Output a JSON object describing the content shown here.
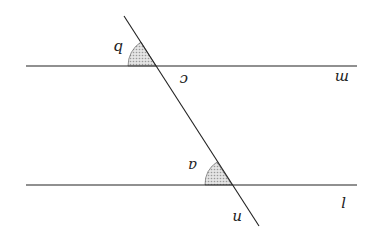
{
  "diagram": {
    "rotation_deg": 180,
    "lines": [
      {
        "id": "m",
        "label": "m",
        "x1": 26,
        "y1": 66,
        "x2": 357,
        "y2": 66
      },
      {
        "id": "l",
        "label": "l",
        "x1": 26,
        "y1": 185,
        "x2": 357,
        "y2": 185
      },
      {
        "id": "n",
        "label": "n",
        "x1": 124,
        "y1": 16,
        "x2": 259,
        "y2": 226
      }
    ],
    "angles": [
      {
        "id": "b",
        "label": "b",
        "shaded": true
      },
      {
        "id": "a",
        "label": "a",
        "shaded": true
      }
    ],
    "point_labels": [
      {
        "id": "c",
        "label": "c"
      }
    ],
    "colors": {
      "stroke": "#222222",
      "shade": "#c8c8c8"
    }
  }
}
